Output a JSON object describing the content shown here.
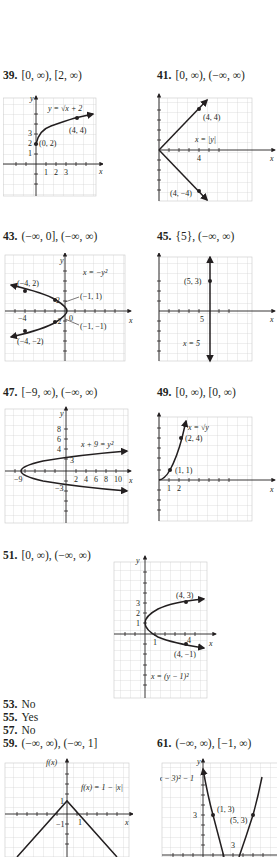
{
  "answers": [
    {
      "num": "39.",
      "text": "[0, ∞), [2, ∞)"
    },
    {
      "num": "41.",
      "text": "[0, ∞), (−∞, ∞)"
    },
    {
      "num": "43.",
      "text": "(−∞, 0], (−∞, ∞)"
    },
    {
      "num": "45.",
      "text": "{5}, (−∞, ∞)"
    },
    {
      "num": "47.",
      "text": "[−9, ∞), (−∞, ∞)"
    },
    {
      "num": "49.",
      "text": "[0, ∞), [0, ∞)"
    },
    {
      "num": "51.",
      "text": "[0, ∞), (−∞, ∞)"
    },
    {
      "num": "53.",
      "text": "No"
    },
    {
      "num": "55.",
      "text": "Yes"
    },
    {
      "num": "57.",
      "text": "No"
    },
    {
      "num": "59.",
      "text": "(−∞, ∞), (−∞, 1]"
    },
    {
      "num": "61.",
      "text": "(−∞, ∞), [−1, ∞)"
    }
  ],
  "graphs": {
    "g39": {
      "equation": "y = √x + 2",
      "points": [
        "(0, 2)",
        "(4, 4)"
      ],
      "yticks": [
        "3",
        "2",
        "1"
      ],
      "xticks": [
        "1",
        "2",
        "3"
      ],
      "xlabel": "x",
      "ylabel": "y"
    },
    "g41": {
      "equation": "x = |y|",
      "points": [
        "(4, 4)",
        "(4, −4)"
      ],
      "yticks": [
        "4",
        "−4"
      ],
      "xticks": [
        "4"
      ],
      "origin": "0",
      "xlabel": "x",
      "ylabel": "y"
    },
    "g43": {
      "equation": "x = −y²",
      "points": [
        "(−4, 2)",
        "(−1, 1)",
        "(−1, −1)",
        "(−4, −2)"
      ],
      "yticks": [
        "2",
        "−2"
      ],
      "xticks": [
        "−4"
      ],
      "origin": "0",
      "xlabel": "x",
      "ylabel": "y"
    },
    "g45": {
      "equation": "x = 5",
      "points": [
        "(5, 3)"
      ],
      "yticks": [
        "3"
      ],
      "xticks": [
        "5"
      ],
      "xlabel": "x",
      "ylabel": "y"
    },
    "g47": {
      "equation": "x + 9 = y²",
      "points": [],
      "yticks": [
        "8",
        "6",
        "4",
        "3",
        "−3"
      ],
      "xticks": [
        "−9",
        "2",
        "4",
        "6",
        "8",
        "10"
      ],
      "xlabel": "x",
      "ylabel": "y"
    },
    "g49": {
      "equation": "x = √y",
      "points": [
        "(2, 4)",
        "(1, 1)"
      ],
      "yticks": [
        "4",
        "1"
      ],
      "xticks": [
        "1",
        "2"
      ],
      "xlabel": "x",
      "ylabel": "y"
    },
    "g51": {
      "equation": "x = (y − 1)²",
      "points": [
        "(4, 3)",
        "(4, −1)"
      ],
      "yticks": [
        "3",
        "2",
        "1"
      ],
      "xticks": [
        "1",
        "4"
      ],
      "xlabel": "x",
      "ylabel": "y"
    },
    "g59": {
      "equation": "f(x) = 1 − |x|",
      "points": [],
      "yticks": [
        "1",
        "−1"
      ],
      "xticks": [
        "1"
      ],
      "xlabel": "x",
      "ylabel": "f(x)"
    },
    "g61": {
      "equation": "y = (x − 3)² − 1",
      "points": [
        "(1, 3)",
        "(5, 3)"
      ],
      "yticks": [
        "3"
      ],
      "xticks": [
        "3"
      ],
      "xlabel": "x",
      "ylabel": "y"
    }
  }
}
